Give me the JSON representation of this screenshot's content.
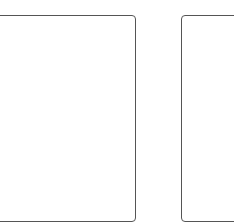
{
  "panels": [
    {
      "id": "left",
      "content": ""
    },
    {
      "id": "right",
      "content": ""
    }
  ],
  "colors": {
    "border": "#555555",
    "background": "#ffffff"
  }
}
